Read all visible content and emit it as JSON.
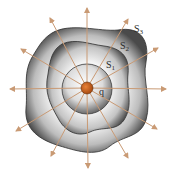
{
  "diagram": {
    "title": "",
    "charge_label": "q",
    "surfaces": [
      {
        "name": "S1",
        "label": "S",
        "sub": "1"
      },
      {
        "name": "S2",
        "label": "S",
        "sub": "2"
      },
      {
        "name": "S3",
        "label": "S",
        "sub": "3"
      }
    ],
    "colors": {
      "charge": "#c8621e",
      "field_lines": "#c99a74",
      "surface_dark": "#555555",
      "surface_light": "#e8e8e8",
      "outline": "#333333"
    },
    "field_line_count": 12
  }
}
